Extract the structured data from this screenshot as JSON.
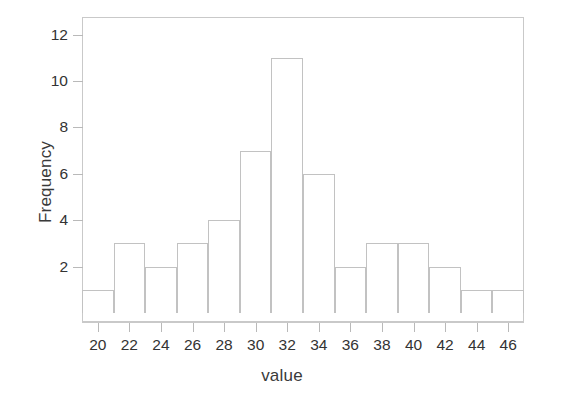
{
  "chart_data": {
    "type": "bar",
    "title": "",
    "subtitle": "",
    "xlabel": "value",
    "ylabel": "Frequency",
    "xlim": [
      19,
      47
    ],
    "ylim": [
      0,
      13
    ],
    "grid": false,
    "legend": null,
    "bin_width": 2,
    "bin_edges": [
      19,
      21,
      23,
      25,
      27,
      29,
      31,
      33,
      35,
      37,
      39,
      41,
      43,
      45,
      47
    ],
    "categories": [
      "19-21",
      "21-23",
      "23-25",
      "25-27",
      "27-29",
      "29-31",
      "31-33",
      "33-35",
      "35-37",
      "37-39",
      "39-41",
      "41-43",
      "43-45",
      "45-47"
    ],
    "bin_centers": [
      20,
      22,
      24,
      26,
      28,
      30,
      32,
      34,
      36,
      38,
      40,
      42,
      44,
      46
    ],
    "values": [
      1,
      3,
      2,
      3,
      4,
      7,
      11,
      6,
      2,
      3,
      3,
      2,
      1,
      1
    ],
    "total_count": 43,
    "xticks": [
      20,
      22,
      24,
      26,
      28,
      30,
      32,
      34,
      36,
      38,
      40,
      42,
      44,
      46
    ],
    "xtick_labels": [
      "20",
      "22",
      "24",
      "26",
      "28",
      "30",
      "32",
      "34",
      "36",
      "38",
      "40",
      "42",
      "44",
      "46"
    ],
    "yticks": [
      2,
      4,
      6,
      8,
      10,
      12
    ],
    "ytick_labels": [
      "2",
      "4",
      "6",
      "8",
      "10",
      "12"
    ],
    "colors": {
      "bar_edge": "#c2c2c2",
      "bar_fill": "transparent",
      "axis": "#c9c9c9",
      "text": "#333333",
      "background": "#ffffff"
    }
  }
}
